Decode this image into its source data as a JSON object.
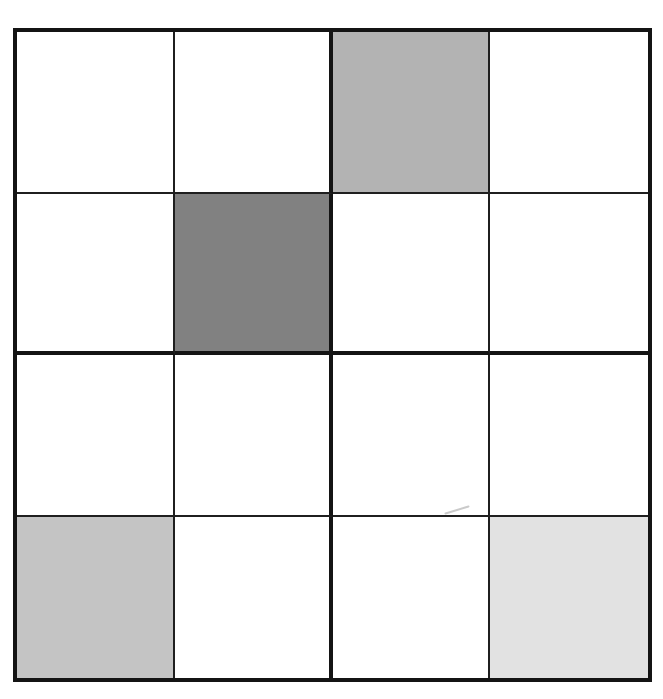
{
  "canvas": {
    "width": 663,
    "height": 699,
    "background": "#ffffff"
  },
  "grid": {
    "rows": 4,
    "cols": 4,
    "block_size": 2,
    "line_colors": {
      "thick": "#141414",
      "thin": "#1f1f1f"
    },
    "palette": {
      "white": "#ffffff",
      "dark_gray": "#818181",
      "medium_gray": "#b3b3b3",
      "medium_light_gray": "#c4c4c4",
      "light_gray": "#e2e2e2"
    },
    "cells": [
      [
        "white",
        "white",
        "medium_gray",
        "white"
      ],
      [
        "white",
        "dark_gray",
        "white",
        "white"
      ],
      [
        "white",
        "white",
        "white",
        "white"
      ],
      [
        "medium_light_gray",
        "white",
        "white",
        "light_gray"
      ]
    ],
    "shaded_cells": [
      {
        "row": 1,
        "col": 3,
        "shade": "medium_gray",
        "hex": "#b3b3b3"
      },
      {
        "row": 2,
        "col": 2,
        "shade": "dark_gray",
        "hex": "#818181"
      },
      {
        "row": 4,
        "col": 1,
        "shade": "medium_light_gray",
        "hex": "#c4c4c4"
      },
      {
        "row": 4,
        "col": 4,
        "shade": "light_gray",
        "hex": "#e2e2e2"
      }
    ]
  },
  "artifact": {
    "type": "pencil-scratch",
    "color": "#bdbdbd",
    "location": "row-4-col-3"
  }
}
